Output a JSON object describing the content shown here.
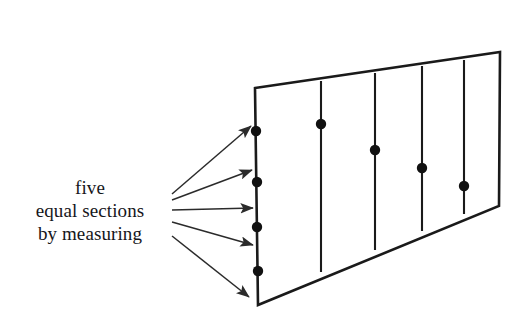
{
  "figure": {
    "title": "five equal sections by measuring",
    "background_color": "#ffffff",
    "ink_color": "#1a1a1a",
    "dot_color": "#111111",
    "arrow_color": "#2b2b2b",
    "width": 528,
    "height": 329
  },
  "caption": {
    "lines": [
      "five",
      "equal sections",
      "by measuring"
    ],
    "line1": "five",
    "line2": "equal sections",
    "line3": "by measuring"
  },
  "diagram_data": {
    "type": "perspective-division-diagram",
    "description": "A quadrilateral plane shown in perspective, subdivided by four vertical lines into five equal sections; the near (left) edge carries four measuring marks and each division line carries a marked point.",
    "section_count": 5,
    "divider_count": 4,
    "plane_quad": {
      "name": "perspective-plane",
      "top_left": [
        255,
        88
      ],
      "top_right": [
        500,
        52
      ],
      "bottom_right": [
        499,
        206
      ],
      "bottom_left": [
        258,
        305
      ],
      "stroke_width": 2.6
    },
    "dividers": [
      {
        "index": 1,
        "x": 321,
        "y_top": 81,
        "y_bottom": 272,
        "dot": [
          321,
          124
        ]
      },
      {
        "index": 2,
        "x": 375,
        "y_top": 73,
        "y_bottom": 250,
        "dot": [
          375,
          150
        ]
      },
      {
        "index": 3,
        "x": 422,
        "y_top": 66,
        "y_bottom": 231,
        "dot": [
          422,
          168
        ]
      },
      {
        "index": 4,
        "x": 464,
        "y_top": 60,
        "y_bottom": 214,
        "dot": [
          464,
          186
        ]
      }
    ],
    "near_edge_marks": [
      {
        "index": 1,
        "point": [
          256,
          131
        ]
      },
      {
        "index": 2,
        "point": [
          257,
          182
        ]
      },
      {
        "index": 3,
        "point": [
          257,
          227
        ]
      },
      {
        "index": 4,
        "point": [
          258,
          271
        ]
      }
    ],
    "dot_radius": 5.2,
    "arrows": [
      {
        "index": 1,
        "from": [
          172,
          194
        ],
        "to": [
          251,
          126
        ]
      },
      {
        "index": 2,
        "from": [
          172,
          200
        ],
        "to": [
          252,
          170
        ]
      },
      {
        "index": 3,
        "from": [
          172,
          210
        ],
        "to": [
          253,
          208
        ]
      },
      {
        "index": 4,
        "from": [
          172,
          222
        ],
        "to": [
          253,
          245
        ]
      },
      {
        "index": 5,
        "from": [
          172,
          236
        ],
        "to": [
          249,
          297
        ]
      }
    ],
    "arrow_stroke_width": 1.5,
    "arrow_head_length": 11
  }
}
